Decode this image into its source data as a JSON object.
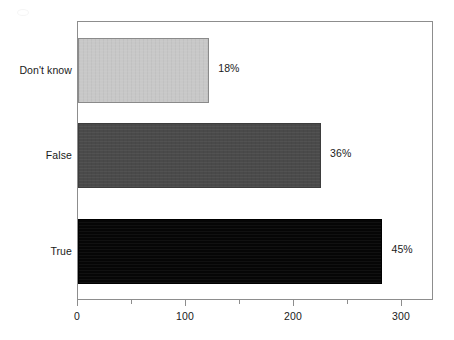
{
  "chart_data": {
    "type": "bar",
    "orientation": "horizontal",
    "title": "",
    "subtitle": "",
    "xlabel": "",
    "ylabel": "",
    "categories": [
      "True",
      "False",
      "Don't know"
    ],
    "values": [
      283,
      226,
      122
    ],
    "data_labels": [
      "45%",
      "36%",
      "18%"
    ],
    "series": [
      {
        "name": "",
        "values": [
          283,
          226,
          122
        ],
        "data_labels": [
          "45%",
          "36%",
          "18%"
        ]
      }
    ],
    "bars": [
      {
        "category": "Don't know",
        "value": 122,
        "data_label": "18%",
        "color": "#c8c8c8"
      },
      {
        "category": "False",
        "value": 226,
        "data_label": "36%",
        "color": "#4a4a4a"
      },
      {
        "category": "True",
        "value": 283,
        "data_label": "45%",
        "color": "#060606"
      }
    ],
    "xlim": [
      0,
      330
    ],
    "xticks": [
      0,
      100,
      200,
      300
    ],
    "xtick_labels": [
      "0",
      "100",
      "200",
      "300"
    ],
    "x_minor_ticks": [
      50,
      150,
      250
    ],
    "grid": false,
    "legend": "none",
    "frame_color": "#8d8d8d",
    "background": "#ffffff"
  },
  "axis": {
    "x_labels": [
      "0",
      "100",
      "200",
      "300"
    ]
  },
  "categories": {
    "dont_know": "Don't know",
    "false": "False",
    "true": "True"
  },
  "labels": {
    "dont_know_pct": "18%",
    "false_pct": "36%",
    "true_pct": "45%"
  }
}
